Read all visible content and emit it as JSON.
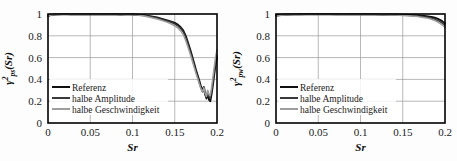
{
  "figure": {
    "background": "#fdfdfd",
    "panel_count": 2
  },
  "chart_data": [
    {
      "id": "gamma-ps",
      "type": "line",
      "title": "",
      "xlabel": "Sr",
      "ylabel": "γ²ps(Sr)",
      "ylabel_parts": {
        "symbol": "γ",
        "superscript": "2",
        "subscript": "ps",
        "argument": "(Sr)"
      },
      "xlim": [
        0,
        0.2
      ],
      "ylim": [
        0,
        1
      ],
      "xticks": [
        0,
        0.05,
        0.1,
        0.15,
        0.2
      ],
      "xticklabels": [
        "0",
        "0.05",
        "0.1",
        "0.15",
        "0.2"
      ],
      "yticks": [
        0,
        0.2,
        0.4,
        0.6,
        0.8,
        1
      ],
      "yticklabels": [
        "0",
        "0.2",
        "0.4",
        "0.6",
        "0.8",
        "1"
      ],
      "grid": true,
      "legend_position": "lower-left",
      "series": [
        {
          "name": "Referenz",
          "color": "#111111",
          "width": 1.9,
          "x": [
            0,
            0.004,
            0.008,
            0.012,
            0.017,
            0.022,
            0.027,
            0.032,
            0.038,
            0.044,
            0.05,
            0.056,
            0.062,
            0.068,
            0.074,
            0.08,
            0.086,
            0.092,
            0.098,
            0.104,
            0.109,
            0.114,
            0.119,
            0.124,
            0.129,
            0.134,
            0.138,
            0.142,
            0.146,
            0.15,
            0.154,
            0.157,
            0.16,
            0.163,
            0.166,
            0.169,
            0.171,
            0.173,
            0.175,
            0.177,
            0.179,
            0.181,
            0.183,
            0.1845,
            0.186,
            0.1875,
            0.189,
            0.1905,
            0.192,
            0.1935,
            0.195,
            0.1965,
            0.198,
            0.2
          ],
          "y": [
            0.985,
            0.992,
            0.996,
            0.997,
            0.998,
            0.998,
            0.997,
            0.998,
            0.998,
            0.997,
            0.998,
            0.998,
            0.997,
            0.998,
            0.997,
            0.998,
            0.996,
            0.997,
            0.998,
            0.996,
            0.992,
            0.988,
            0.982,
            0.975,
            0.968,
            0.958,
            0.949,
            0.94,
            0.93,
            0.918,
            0.9,
            0.878,
            0.85,
            0.8,
            0.73,
            0.655,
            0.6,
            0.545,
            0.49,
            0.44,
            0.39,
            0.335,
            0.3,
            0.33,
            0.27,
            0.225,
            0.27,
            0.215,
            0.2,
            0.26,
            0.34,
            0.43,
            0.52,
            0.6
          ]
        },
        {
          "name": "halbe Amplitude",
          "color": "#3a3a3a",
          "width": 1.5,
          "x": [
            0,
            0.004,
            0.008,
            0.012,
            0.017,
            0.022,
            0.027,
            0.032,
            0.038,
            0.044,
            0.05,
            0.056,
            0.062,
            0.068,
            0.074,
            0.08,
            0.086,
            0.092,
            0.098,
            0.104,
            0.109,
            0.114,
            0.119,
            0.124,
            0.129,
            0.134,
            0.138,
            0.142,
            0.146,
            0.15,
            0.154,
            0.157,
            0.16,
            0.163,
            0.166,
            0.169,
            0.171,
            0.173,
            0.175,
            0.177,
            0.179,
            0.181,
            0.183,
            0.1845,
            0.186,
            0.1875,
            0.189,
            0.1905,
            0.192,
            0.1935,
            0.195,
            0.1965,
            0.198,
            0.2
          ],
          "y": [
            0.978,
            0.99,
            0.995,
            0.996,
            0.997,
            0.997,
            0.996,
            0.997,
            0.996,
            0.996,
            0.997,
            0.996,
            0.996,
            0.997,
            0.996,
            0.996,
            0.995,
            0.996,
            0.996,
            0.994,
            0.99,
            0.986,
            0.979,
            0.972,
            0.963,
            0.952,
            0.943,
            0.933,
            0.922,
            0.908,
            0.888,
            0.866,
            0.836,
            0.785,
            0.715,
            0.64,
            0.585,
            0.53,
            0.475,
            0.425,
            0.372,
            0.32,
            0.285,
            0.315,
            0.255,
            0.235,
            0.29,
            0.24,
            0.225,
            0.285,
            0.365,
            0.455,
            0.545,
            0.625
          ]
        },
        {
          "name": "halbe Geschwindigkeit",
          "color": "#9e9e9e",
          "width": 1.5,
          "x": [
            0,
            0.004,
            0.008,
            0.012,
            0.017,
            0.022,
            0.027,
            0.032,
            0.038,
            0.044,
            0.05,
            0.056,
            0.062,
            0.068,
            0.074,
            0.08,
            0.086,
            0.092,
            0.098,
            0.104,
            0.109,
            0.114,
            0.119,
            0.124,
            0.129,
            0.134,
            0.138,
            0.142,
            0.146,
            0.15,
            0.154,
            0.157,
            0.16,
            0.163,
            0.166,
            0.169,
            0.171,
            0.173,
            0.175,
            0.177,
            0.179,
            0.181,
            0.183,
            0.1845,
            0.186,
            0.1875,
            0.189,
            0.1905,
            0.192,
            0.1935,
            0.195,
            0.1965,
            0.198,
            0.2
          ],
          "y": [
            0.982,
            0.991,
            0.995,
            0.996,
            0.997,
            0.997,
            0.997,
            0.997,
            0.997,
            0.996,
            0.997,
            0.997,
            0.996,
            0.997,
            0.996,
            0.996,
            0.995,
            0.995,
            0.995,
            0.992,
            0.987,
            0.981,
            0.973,
            0.964,
            0.954,
            0.943,
            0.932,
            0.921,
            0.908,
            0.892,
            0.87,
            0.845,
            0.812,
            0.757,
            0.688,
            0.615,
            0.562,
            0.51,
            0.458,
            0.41,
            0.36,
            0.315,
            0.285,
            0.325,
            0.275,
            0.245,
            0.3,
            0.26,
            0.25,
            0.32,
            0.41,
            0.5,
            0.59,
            0.675
          ]
        }
      ]
    },
    {
      "id": "gamma-pw",
      "type": "line",
      "title": "",
      "xlabel": "Sr",
      "ylabel": "γ²pw(Sr)",
      "ylabel_parts": {
        "symbol": "γ",
        "superscript": "2",
        "subscript": "pw",
        "argument": "(Sr)"
      },
      "xlim": [
        0,
        0.2
      ],
      "ylim": [
        0,
        1
      ],
      "xticks": [
        0,
        0.05,
        0.1,
        0.15,
        0.2
      ],
      "xticklabels": [
        "0",
        "0.05",
        "0.1",
        "0.15",
        "0.2"
      ],
      "yticks": [
        0,
        0.2,
        0.4,
        0.6,
        0.8,
        1
      ],
      "yticklabels": [
        "0",
        "0.2",
        "0.4",
        "0.6",
        "0.8",
        "1"
      ],
      "grid": true,
      "legend_position": "lower-left",
      "series": [
        {
          "name": "Referenz",
          "color": "#111111",
          "width": 1.9,
          "x": [
            0,
            0.006,
            0.012,
            0.02,
            0.028,
            0.036,
            0.045,
            0.054,
            0.063,
            0.072,
            0.081,
            0.09,
            0.099,
            0.108,
            0.117,
            0.126,
            0.134,
            0.142,
            0.15,
            0.157,
            0.163,
            0.168,
            0.172,
            0.176,
            0.18,
            0.184,
            0.188,
            0.191,
            0.194,
            0.197,
            0.2
          ],
          "y": [
            0.988,
            0.994,
            0.996,
            0.997,
            0.998,
            0.998,
            0.998,
            0.998,
            0.998,
            0.998,
            0.997,
            0.998,
            0.997,
            0.997,
            0.997,
            0.996,
            0.996,
            0.995,
            0.994,
            0.992,
            0.99,
            0.988,
            0.985,
            0.982,
            0.978,
            0.973,
            0.966,
            0.958,
            0.947,
            0.932,
            0.915
          ]
        },
        {
          "name": "halbe Amplitude",
          "color": "#3a3a3a",
          "width": 1.5,
          "x": [
            0,
            0.006,
            0.012,
            0.02,
            0.028,
            0.036,
            0.045,
            0.054,
            0.063,
            0.072,
            0.081,
            0.09,
            0.099,
            0.108,
            0.117,
            0.126,
            0.134,
            0.142,
            0.15,
            0.157,
            0.163,
            0.168,
            0.172,
            0.176,
            0.18,
            0.184,
            0.188,
            0.191,
            0.194,
            0.197,
            0.2
          ],
          "y": [
            0.982,
            0.991,
            0.994,
            0.996,
            0.996,
            0.997,
            0.997,
            0.997,
            0.997,
            0.996,
            0.996,
            0.996,
            0.996,
            0.995,
            0.995,
            0.994,
            0.993,
            0.992,
            0.99,
            0.987,
            0.984,
            0.981,
            0.977,
            0.973,
            0.968,
            0.961,
            0.952,
            0.942,
            0.93,
            0.915,
            0.898
          ]
        },
        {
          "name": "halbe Geschwindigkeit",
          "color": "#9e9e9e",
          "width": 1.5,
          "x": [
            0,
            0.006,
            0.012,
            0.02,
            0.028,
            0.036,
            0.045,
            0.054,
            0.063,
            0.072,
            0.081,
            0.09,
            0.099,
            0.108,
            0.117,
            0.126,
            0.134,
            0.142,
            0.15,
            0.157,
            0.163,
            0.168,
            0.172,
            0.176,
            0.18,
            0.184,
            0.188,
            0.191,
            0.194,
            0.197,
            0.2
          ],
          "y": [
            0.978,
            0.989,
            0.993,
            0.995,
            0.996,
            0.996,
            0.996,
            0.996,
            0.996,
            0.995,
            0.995,
            0.995,
            0.994,
            0.994,
            0.993,
            0.992,
            0.991,
            0.99,
            0.987,
            0.984,
            0.98,
            0.976,
            0.971,
            0.966,
            0.96,
            0.951,
            0.94,
            0.928,
            0.914,
            0.897,
            0.878
          ]
        }
      ]
    }
  ]
}
